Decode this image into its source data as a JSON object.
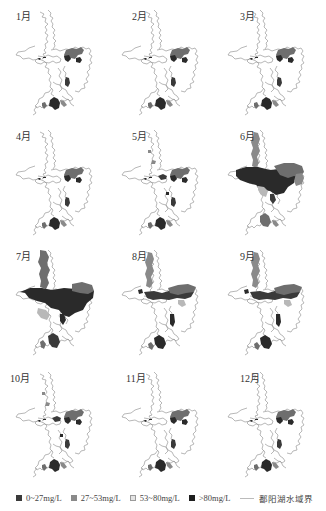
{
  "figure": {
    "subject": "鄱阳湖",
    "layout": {
      "rows": 4,
      "cols": 3
    },
    "panels": [
      {
        "label": "1月",
        "level": "low"
      },
      {
        "label": "2月",
        "level": "low"
      },
      {
        "label": "3月",
        "level": "low"
      },
      {
        "label": "4月",
        "level": "low"
      },
      {
        "label": "5月",
        "level": "low-mid"
      },
      {
        "label": "6月",
        "level": "high"
      },
      {
        "label": "7月",
        "level": "very-high"
      },
      {
        "label": "8月",
        "level": "mid"
      },
      {
        "label": "9月",
        "level": "mid"
      },
      {
        "label": "10月",
        "level": "low-mid"
      },
      {
        "label": "11月",
        "level": "low"
      },
      {
        "label": "12月",
        "level": "low"
      }
    ]
  },
  "legend": {
    "items": [
      {
        "label": "0~27mg/L",
        "swatch": "#3a3a3a",
        "border": "#3a3a3a"
      },
      {
        "label": "27~53mg/L",
        "swatch": "#8a8a8a",
        "border": "#8a8a8a"
      },
      {
        "label": "53~80mg/L",
        "swatch": "#e4e4e4",
        "border": "#9a9a9a"
      },
      {
        "label": ">80mg/L",
        "swatch": "#1e1e1e",
        "border": "#1e1e1e"
      }
    ],
    "boundary_label": "鄱阳湖水域界",
    "boundary_color": "#bbbbbb"
  },
  "colors": {
    "outline": "#9a9a9a",
    "dark": "#2a2a2a",
    "mid": "#6e6e6e",
    "light": "#b8b8b8"
  }
}
